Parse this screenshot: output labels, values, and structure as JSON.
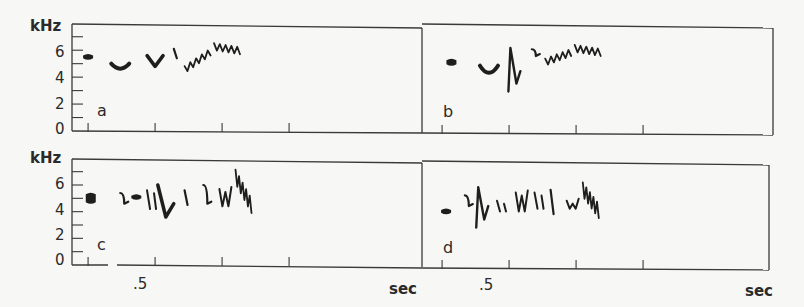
{
  "chart_data": {
    "type": "heatmap",
    "title": "",
    "xlabel": "sec",
    "ylabel": "kHz",
    "yticks": [
      0,
      2,
      4,
      6
    ],
    "ylim": [
      0,
      7.5
    ],
    "xtick_step": 0.25,
    "xtick_label": ".5",
    "panels": [
      {
        "label": "a",
        "row": "top",
        "col": "left",
        "show_ylabels": true,
        "show_xlabels": false,
        "notes": [
          {
            "t": 0.5,
            "f": [
              5.6,
              5.4
            ],
            "shape": "blob"
          },
          {
            "t": 0.62,
            "f": [
              5.0,
              4.7,
              5.0
            ],
            "shape": "dip"
          },
          {
            "t": 0.75,
            "f": [
              5.6,
              4.8,
              5.6
            ],
            "shape": "v"
          },
          {
            "t": 0.82,
            "f": [
              6.1,
              5.4
            ],
            "shape": "stroke"
          },
          {
            "t": 0.86,
            "f": [
              4.6,
              5.9
            ],
            "shape": "trill-rising"
          },
          {
            "t": 0.97,
            "f": [
              6.3,
              6.0
            ],
            "shape": "trill-flat"
          }
        ]
      },
      {
        "label": "b",
        "row": "top",
        "col": "right",
        "show_ylabels": false,
        "show_xlabels": false,
        "notes": [
          {
            "t": 0.52,
            "f": [
              5.3,
              5.0
            ],
            "shape": "blob"
          },
          {
            "t": 0.66,
            "f": [
              4.9,
              4.3,
              4.9
            ],
            "shape": "dip"
          },
          {
            "t": 0.74,
            "f": [
              6.2,
              3.6,
              4.5
            ],
            "shape": "zigzag"
          },
          {
            "t": 0.82,
            "f": [
              6.1,
              5.6
            ],
            "shape": "hook"
          },
          {
            "t": 0.87,
            "f": [
              5.2,
              5.9
            ],
            "shape": "trill-rising"
          },
          {
            "t": 0.98,
            "f": [
              6.2,
              5.9
            ],
            "shape": "trill-flat"
          }
        ]
      },
      {
        "label": "c",
        "row": "bottom",
        "col": "left",
        "show_ylabels": true,
        "show_xlabels": true,
        "notes": [
          {
            "t": 0.51,
            "f": [
              5.3,
              4.7
            ],
            "shape": "blob"
          },
          {
            "t": 0.62,
            "f": [
              5.4,
              4.6
            ],
            "shape": "hook"
          },
          {
            "t": 0.68,
            "f": [
              5.2,
              5.0
            ],
            "shape": "blob"
          },
          {
            "t": 0.72,
            "f": [
              5.6,
              4.2
            ],
            "shape": "stroke-pair"
          },
          {
            "t": 0.79,
            "f": [
              6.0,
              3.6,
              4.6
            ],
            "shape": "v"
          },
          {
            "t": 0.86,
            "f": [
              5.6,
              4.5
            ],
            "shape": "stroke"
          },
          {
            "t": 0.93,
            "f": [
              6.0,
              4.6
            ],
            "shape": "hook"
          },
          {
            "t": 0.99,
            "f": [
              5.7,
              4.4
            ],
            "shape": "w"
          },
          {
            "t": 1.05,
            "f": [
              7.0,
              4.8
            ],
            "shape": "trill"
          }
        ]
      },
      {
        "label": "d",
        "row": "bottom",
        "col": "right",
        "show_ylabels": false,
        "show_xlabels": true,
        "notes": [
          {
            "t": 0.5,
            "f": [
              4.3,
              4.1
            ],
            "shape": "blob"
          },
          {
            "t": 0.57,
            "f": [
              5.4,
              4.6
            ],
            "shape": "hook"
          },
          {
            "t": 0.62,
            "f": [
              6.0,
              3.6,
              4.6
            ],
            "shape": "zigzag"
          },
          {
            "t": 0.69,
            "f": [
              5.0,
              4.2
            ],
            "shape": "stroke-pair"
          },
          {
            "t": 0.76,
            "f": [
              5.6,
              4.2
            ],
            "shape": "w"
          },
          {
            "t": 0.83,
            "f": [
              5.6,
              4.4
            ],
            "shape": "stroke-pair"
          },
          {
            "t": 0.89,
            "f": [
              5.8,
              4.0
            ],
            "shape": "stroke"
          },
          {
            "t": 0.95,
            "f": [
              5.0,
              4.4
            ],
            "shape": "w"
          },
          {
            "t": 1.01,
            "f": [
              6.2,
              4.6
            ],
            "shape": "trill"
          }
        ]
      }
    ]
  },
  "labels": {
    "y_unit": "kHz",
    "y_ticks": [
      "0",
      "2",
      "4",
      "6"
    ],
    "x_first_label": ".5",
    "x_unit": "sec",
    "panel_labels": [
      "a",
      "b",
      "c",
      "d"
    ]
  }
}
